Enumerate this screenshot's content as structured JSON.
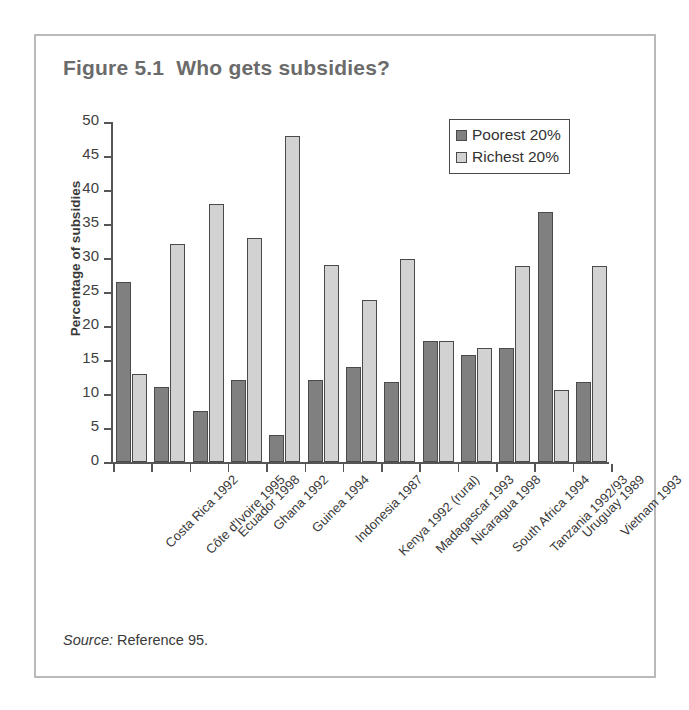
{
  "figure": {
    "title": "Figure 5.1  Who gets subsidies?",
    "source_word": "Source:",
    "source_text": " Reference 95."
  },
  "legend": {
    "position": "top-right",
    "items": [
      {
        "label": "Poorest 20%",
        "color": "#808080"
      },
      {
        "label": "Richest 20%",
        "color": "#d2d2d2"
      }
    ]
  },
  "chart_data": {
    "type": "bar",
    "title": "Figure 5.1  Who gets subsidies?",
    "xlabel": "",
    "ylabel": "Percentage of subsidies",
    "ylim": [
      0,
      50
    ],
    "yticks": [
      0,
      5,
      10,
      15,
      20,
      25,
      30,
      35,
      40,
      45,
      50
    ],
    "ytick_labels": [
      "0",
      "5",
      "10",
      "15",
      "20",
      "25",
      "30",
      "35",
      "40",
      "45",
      "50"
    ],
    "grid": false,
    "legend_position": "top-right",
    "categories": [
      "Costa Rica 1992",
      "Côte d'Ivoire 1995",
      "Ecuador 1998",
      "Ghana 1992",
      "Guinea 1994",
      "Indonesia 1987",
      "Kenya 1992 (rural)",
      "Madagascar 1993",
      "Nicaragua 1998",
      "South Africa 1994",
      "Tanzania 1992/93",
      "Uruguay 1989",
      "Vietnam 1993"
    ],
    "series": [
      {
        "name": "Poorest 20%",
        "color": "#808080",
        "values": [
          26.5,
          11.0,
          7.5,
          12.0,
          4.0,
          12.0,
          13.9,
          11.8,
          17.8,
          15.7,
          16.7,
          36.7,
          11.7
        ]
      },
      {
        "name": "Richest 20%",
        "color": "#d2d2d2",
        "values": [
          13.0,
          32.0,
          38.0,
          33.0,
          48.0,
          29.0,
          23.8,
          29.9,
          17.8,
          16.7,
          28.8,
          10.6,
          28.8
        ]
      }
    ]
  }
}
